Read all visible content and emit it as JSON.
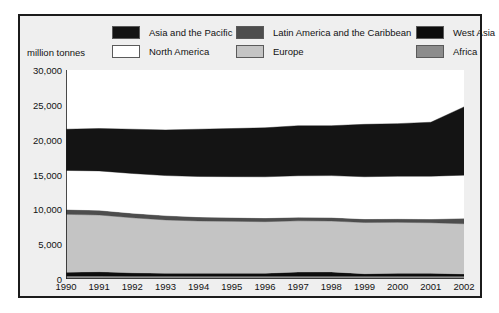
{
  "unit_label": "million tonnes",
  "legend": {
    "items": [
      {
        "label": "Asia and the Pacific",
        "color": "#141414",
        "col": 1,
        "row": 1
      },
      {
        "label": "North America",
        "color": "#ffffff",
        "col": 2,
        "row": 1
      },
      {
        "label": "Latin America and the Caribbean",
        "color": "#4d4d4d",
        "col": 3,
        "row": 1
      },
      {
        "label": "Europe",
        "color": "#c4c4c4",
        "col": 4,
        "row": 1
      },
      {
        "label": "West Asia",
        "color": "#0d0d0d",
        "col": 5,
        "row": 1
      },
      {
        "label": "Africa",
        "color": "#8c8c8c",
        "col": 6,
        "row": 1
      }
    ]
  },
  "chart_data": {
    "type": "area",
    "stacked": true,
    "title": "",
    "subtitle": "",
    "xlabel": "",
    "ylabel": "million tonnes",
    "ylim": [
      0,
      30000
    ],
    "ytick_values": [
      0,
      5000,
      10000,
      15000,
      20000,
      25000,
      30000
    ],
    "ytick_labels": [
      "0",
      "5,000",
      "10,000",
      "15,000",
      "20,000",
      "25,000",
      "30,000"
    ],
    "grid": false,
    "legend_position": "top",
    "categories": [
      1990,
      1991,
      1992,
      1993,
      1994,
      1995,
      1996,
      1997,
      1998,
      1999,
      2000,
      2001,
      2002
    ],
    "x": [
      "1990",
      "1991",
      "1992",
      "1993",
      "1994",
      "1995",
      "1996",
      "1997",
      "1998",
      "1999",
      "2000",
      "2001",
      "2002"
    ],
    "stack_order_bottom_to_top": [
      "Africa",
      "West Asia",
      "Europe",
      "Latin America and the Caribbean",
      "North America",
      "Asia and the Pacific"
    ],
    "series": [
      {
        "name": "Africa",
        "color": "#8c8c8c",
        "values": [
          420,
          420,
          410,
          410,
          400,
          400,
          400,
          400,
          400,
          400,
          400,
          400,
          400
        ]
      },
      {
        "name": "West Asia",
        "color": "#0d0d0d",
        "values": [
          560,
          620,
          480,
          420,
          430,
          430,
          430,
          600,
          620,
          360,
          430,
          430,
          330
        ]
      },
      {
        "name": "Europe",
        "color": "#c4c4c4",
        "values": [
          8300,
          8150,
          7900,
          7650,
          7500,
          7450,
          7400,
          7350,
          7300,
          7350,
          7300,
          7250,
          7200
        ]
      },
      {
        "name": "Latin America and the Caribbean",
        "color": "#4d4d4d",
        "values": [
          700,
          680,
          660,
          620,
          580,
          560,
          540,
          520,
          520,
          520,
          520,
          520,
          780
        ]
      },
      {
        "name": "North America",
        "color": "#ffffff",
        "values": [
          5600,
          5650,
          5700,
          5750,
          5800,
          5850,
          5900,
          5950,
          6000,
          6050,
          6100,
          6150,
          6200
        ]
      },
      {
        "name": "Asia and the Pacific",
        "color": "#141414",
        "values": [
          5920,
          6080,
          6350,
          6550,
          6790,
          6910,
          7030,
          7180,
          7160,
          7520,
          7550,
          7750,
          9790
        ]
      }
    ],
    "totals": [
      21500,
      21600,
      21500,
      21400,
      21500,
      21600,
      21700,
      22000,
      22000,
      22200,
      22300,
      22500,
      24700
    ],
    "annotations": []
  }
}
